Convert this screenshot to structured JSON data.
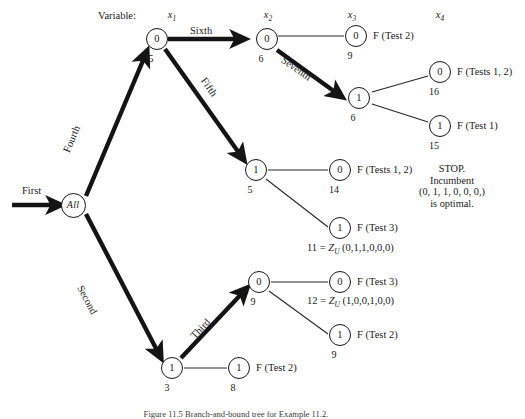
{
  "figure": {
    "header_word": "Variable:",
    "caption": "Figure 11.5 Branch-and-bound tree for Example 11.2.",
    "variable_labels": [
      {
        "id": "x1",
        "text": "x",
        "sub": "1"
      },
      {
        "id": "x2",
        "text": "x",
        "sub": "2"
      },
      {
        "id": "x3",
        "text": "x",
        "sub": "3"
      },
      {
        "id": "x4",
        "text": "x",
        "sub": "4"
      }
    ],
    "start_label": "First",
    "root_label": "All",
    "edge_labels": [
      {
        "id": "first",
        "text": "First"
      },
      {
        "id": "second",
        "text": "Second"
      },
      {
        "id": "third",
        "text": "Third"
      },
      {
        "id": "fourth",
        "text": "Fourth"
      },
      {
        "id": "fifth",
        "text": "Fifth"
      },
      {
        "id": "sixth",
        "text": "Sixth"
      },
      {
        "id": "seventh",
        "text": "Seventh"
      }
    ],
    "nodes": [
      {
        "id": "root",
        "label": "All",
        "value": ""
      },
      {
        "id": "n-x1-0",
        "label": "0",
        "value": "5"
      },
      {
        "id": "n-x1-1",
        "label": "1",
        "value": "3"
      },
      {
        "id": "n-x2-0",
        "label": "0",
        "value": "6"
      },
      {
        "id": "n-x2-1",
        "label": "1",
        "value": "5"
      },
      {
        "id": "n-x2-b",
        "label": "0",
        "value": "9"
      },
      {
        "id": "n-x2-c",
        "label": "1",
        "value": "8"
      },
      {
        "id": "n-x3-0",
        "label": "0",
        "value": "9"
      },
      {
        "id": "n-x3-1",
        "label": "1",
        "value": "6"
      },
      {
        "id": "n-x3-a",
        "label": "0",
        "value": "14"
      },
      {
        "id": "n-x3-b",
        "label": "1",
        "value": ""
      },
      {
        "id": "n-x3-c",
        "label": "0",
        "value": ""
      },
      {
        "id": "n-x3-d",
        "label": "1",
        "value": "9"
      },
      {
        "id": "n-x4-0",
        "label": "0",
        "value": "16"
      },
      {
        "id": "n-x4-1",
        "label": "1",
        "value": "15"
      }
    ],
    "fathom_labels": [
      {
        "id": "f-x3-0",
        "text": "F (Test 2)"
      },
      {
        "id": "f-x4-0",
        "text": "F (Tests 1, 2)"
      },
      {
        "id": "f-x4-1",
        "text": "F (Test 1)"
      },
      {
        "id": "f-x3-a",
        "text": "F (Tests 1, 2)"
      },
      {
        "id": "f-x3-b",
        "text": "F (Test 3)"
      },
      {
        "id": "f-x3-c",
        "text": "F (Test 3)"
      },
      {
        "id": "f-x3-d",
        "text": "F (Test 2)"
      },
      {
        "id": "f-x2-c",
        "text": "F (Test 2)"
      }
    ],
    "incumbent_lines": [
      {
        "id": "z1",
        "value": "11",
        "eq": "=",
        "zu": "Z",
        "zusub": "U",
        "vector": "(0,1,1,0,0,0)"
      },
      {
        "id": "z2",
        "value": "12",
        "eq": "=",
        "zu": "Z",
        "zusub": "U",
        "vector": "(1,0,0,1,0,0)"
      }
    ],
    "stop_note": {
      "line1": "STOP.",
      "line2": "Incumbent",
      "line3": "(0, 1, 1, 0, 0, 0,)",
      "line4": "is optimal."
    }
  }
}
